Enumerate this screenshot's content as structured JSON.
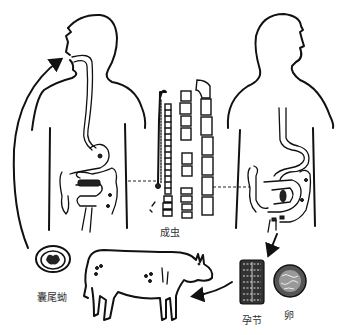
{
  "diagram": {
    "labels": {
      "cysticercus": "囊尾蚴",
      "adult_worm": "成虫",
      "gravid_proglottid": "孕节",
      "egg": "卵"
    },
    "nodes": [
      {
        "id": "human-host-left",
        "role": "human ingesting cysticercus"
      },
      {
        "id": "adult-worm",
        "role": "adult worm in intestine"
      },
      {
        "id": "human-host-right",
        "role": "human passing proglottids"
      },
      {
        "id": "gravid-proglottid",
        "role": "expelled gravid segment"
      },
      {
        "id": "egg",
        "role": "egg"
      },
      {
        "id": "cow",
        "role": "intermediate host"
      },
      {
        "id": "cysticercus",
        "role": "larval cyst in cattle muscle"
      }
    ],
    "edges": [
      {
        "from": "human-host-right",
        "to": "gravid-proglottid",
        "style": "solid-arrow"
      },
      {
        "from": "gravid-proglottid",
        "to": "cow",
        "style": "solid-arrow"
      },
      {
        "from": "cysticercus",
        "to": "human-host-left",
        "style": "solid-arrow"
      },
      {
        "from": "human-host-left",
        "to": "adult-worm",
        "style": "dashed"
      },
      {
        "from": "adult-worm",
        "to": "human-host-right",
        "style": "dashed"
      }
    ]
  }
}
